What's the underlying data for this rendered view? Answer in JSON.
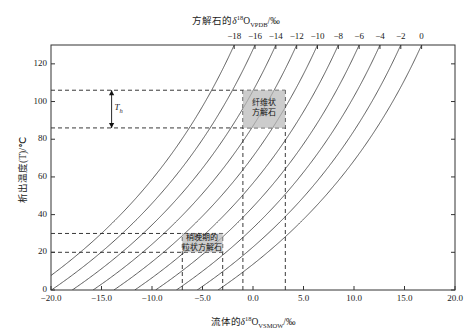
{
  "chart_data": {
    "type": "line",
    "title": "",
    "xlabel": "流体的δ18O_VSMOW/‰",
    "ylabel": "析出温度(T)/℃",
    "top_axis_label": "方解石的δ18O_VPDB/‰",
    "xlim": [
      -20.0,
      20.0
    ],
    "ylim": [
      0,
      130
    ],
    "top_xlim": [
      -20.0,
      2.0
    ],
    "grid": false,
    "legend": "none",
    "xticks": [
      "-20.0",
      "-15.0",
      "-10.0",
      "-5.0",
      "0.0",
      "5.0",
      "10.0",
      "15.0",
      "20.0"
    ],
    "xtick_values": [
      -20,
      -15,
      -10,
      -5,
      0,
      5,
      10,
      15,
      20
    ],
    "yticks": [
      "0",
      "20",
      "40",
      "60",
      "80",
      "100",
      "120"
    ],
    "ytick_values": [
      0,
      20,
      40,
      60,
      80,
      100,
      120
    ],
    "top_ticks": [
      "-18",
      "-16",
      "-14",
      "-12",
      "-10",
      "-8",
      "-6",
      "-4",
      "-2",
      "0"
    ],
    "top_tick_values": [
      -18,
      -16,
      -14,
      -12,
      -10,
      -8,
      -6,
      -4,
      -2,
      0
    ],
    "series": [
      {
        "name": "calcite -18",
        "calcite_d18O": -18
      },
      {
        "name": "calcite -16",
        "calcite_d18O": -16
      },
      {
        "name": "calcite -14",
        "calcite_d18O": -14
      },
      {
        "name": "calcite -12",
        "calcite_d18O": -12
      },
      {
        "name": "calcite -10",
        "calcite_d18O": -10
      },
      {
        "name": "calcite -8",
        "calcite_d18O": -8
      },
      {
        "name": "calcite -6",
        "calcite_d18O": -6
      },
      {
        "name": "calcite -4",
        "calcite_d18O": -4
      },
      {
        "name": "calcite -2",
        "calcite_d18O": -2
      },
      {
        "name": "calcite 0",
        "calcite_d18O": 0
      }
    ],
    "annotations": [
      {
        "name": "fibrous-calcite-box",
        "label_line1": "纤维状",
        "label_line2": "方解石",
        "x_range": [
          -1.0,
          3.2
        ],
        "y_range": [
          86,
          106
        ]
      },
      {
        "name": "granular-calcite-box",
        "label_line1": "稍晚期的",
        "label_line2": "粒状方解石",
        "x_range": [
          -7.0,
          -3.0
        ],
        "y_range": [
          20,
          30
        ]
      },
      {
        "name": "th-bracket",
        "label": "Th",
        "y_range": [
          86,
          106
        ]
      }
    ]
  },
  "axes": {
    "x_title_prefix": "流体的",
    "x_title_delta": "δ",
    "x_title_sup": "18",
    "x_title_o": "O",
    "x_title_sub": "VSMOW",
    "x_title_suffix": "/‰",
    "y_title": "析出温度(T)/℃",
    "top_title_prefix": "方解石的",
    "top_title_delta": "δ",
    "top_title_sup": "18",
    "top_title_o": "O",
    "top_title_sub": "VPDB",
    "top_title_suffix": "/‰"
  },
  "colors": {
    "curve": "#4a4a4a",
    "frame": "#333333",
    "dashed": "#222222",
    "box_fill": "#b8b8b8",
    "hatch": "#555555",
    "background": "#ffffff"
  }
}
